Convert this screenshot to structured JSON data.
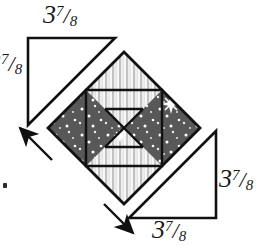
{
  "diagram": {
    "type": "quilting-block-assembly",
    "canvas": {
      "width": 279,
      "height": 249,
      "background": "#ffffff"
    },
    "measurement_labels": [
      {
        "id": "top",
        "text": "3 7/8",
        "whole": "3",
        "numerator": "7",
        "denominator": "8",
        "slash": "/",
        "position": "above-top-left-triangle"
      },
      {
        "id": "left",
        "text": "3 7/8",
        "whole": "3",
        "numerator": "7",
        "denominator": "8",
        "slash": "/",
        "position": "left-of-top-left-triangle",
        "clipped": "true"
      },
      {
        "id": "right",
        "text": "3 7/8",
        "whole": "3",
        "numerator": "7",
        "denominator": "8",
        "slash": "/",
        "position": "right-of-bottom-right-triangle"
      },
      {
        "id": "bottom",
        "text": "3 7/8",
        "whole": "3",
        "numerator": "7",
        "denominator": "8",
        "slash": "/",
        "position": "below-bottom-right-triangle"
      }
    ],
    "colors": {
      "outline": "#111111",
      "star_fabric": "#555555",
      "star_dot": "#ffffff",
      "stripe_light": "#f2f2f2",
      "stripe_dark": "#c0c0c0",
      "triangle_fill": "#ffffff",
      "arrow": "#111111",
      "background": "#ffffff"
    },
    "block": {
      "name": "center-block",
      "orientation": "on-point-diamond",
      "center_x": 124,
      "center_y": 128,
      "half_diagonal": 76,
      "patches": [
        {
          "name": "top-corner-triangle",
          "fabric": "striped"
        },
        {
          "name": "bottom-corner-triangle",
          "fabric": "striped"
        },
        {
          "name": "left-square",
          "fabric": "star-print"
        },
        {
          "name": "right-square",
          "fabric": "star-print"
        },
        {
          "name": "center-hourglass-top",
          "fabric": "striped"
        },
        {
          "name": "center-hourglass-bottom",
          "fabric": "striped"
        },
        {
          "name": "center-hourglass-left",
          "fabric": "star-print"
        },
        {
          "name": "center-hourglass-right",
          "fabric": "star-print"
        }
      ]
    },
    "corner_triangles": [
      {
        "name": "top-left-triangle",
        "fill": "white",
        "right_angle": "top-left"
      },
      {
        "name": "bottom-right-triangle",
        "fill": "white",
        "right_angle": "bottom-right"
      }
    ],
    "arrows": [
      {
        "name": "arrow-upper-left",
        "direction": "up-left",
        "meaning": "attach triangle to upper-left edge"
      },
      {
        "name": "arrow-lower-right",
        "direction": "down-right",
        "meaning": "attach triangle to lower-right edge"
      }
    ],
    "stars": [
      {
        "name": "star-burst-right",
        "x": 171,
        "y": 104,
        "size": "large"
      },
      {
        "name": "star-burst-center",
        "x": 120,
        "y": 135,
        "size": "medium"
      }
    ]
  }
}
